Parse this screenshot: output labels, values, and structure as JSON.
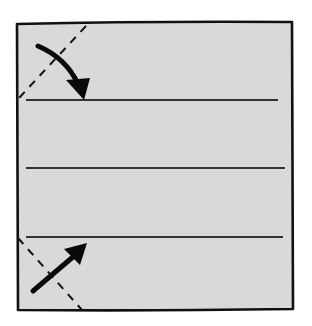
{
  "diagram": {
    "paper": {
      "shape": "square",
      "fill_color": "#d9d9d9",
      "outline_color": "#111111",
      "corners": {
        "tl": [
          17,
          24
        ],
        "tr": [
          292,
          22
        ],
        "br": [
          293,
          309
        ],
        "bl": [
          18,
          310
        ]
      }
    },
    "crease_lines": [
      {
        "name": "upper-crease",
        "y": 100,
        "x_start": 26,
        "x_end": 278
      },
      {
        "name": "middle-crease",
        "y": 168,
        "x_start": 26,
        "x_end": 285
      },
      {
        "name": "lower-crease",
        "y": 237,
        "x_start": 26,
        "x_end": 283
      }
    ],
    "fold_lines": [
      {
        "name": "top-left-corner-fold",
        "style": "dashed",
        "from": [
          86,
          26
        ],
        "to": [
          19,
          98
        ]
      },
      {
        "name": "bottom-left-corner-fold",
        "style": "dashed",
        "from": [
          18,
          238
        ],
        "to": [
          82,
          310
        ]
      }
    ],
    "arrows": [
      {
        "name": "fold-down-arrow",
        "direction": "down-right",
        "from": [
          38,
          45
        ],
        "to": [
          84,
          95
        ]
      },
      {
        "name": "fold-up-arrow",
        "direction": "up-right",
        "from": [
          33,
          291
        ],
        "to": [
          86,
          244
        ]
      }
    ]
  }
}
